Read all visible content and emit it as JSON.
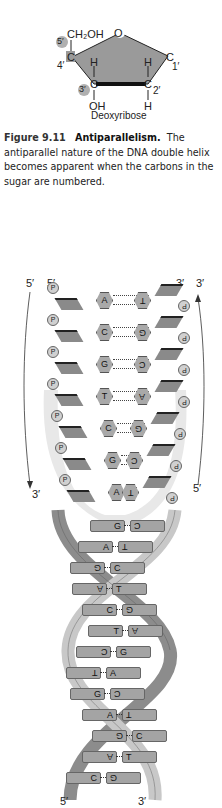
{
  "sugar": {
    "ring_oxygen": "O",
    "ch2oh": "CH₂OH",
    "c4_label": "4′",
    "c1_label": "1′",
    "c2_label": "2′",
    "c3_marker": "3′",
    "c5_marker": "5′",
    "carbon": "C",
    "h_left": "H",
    "h_right": "H",
    "oh_bottom": "OH",
    "h_bottom": "H",
    "name": "Deoxyribose",
    "colors": {
      "ring_fill": "#9a9a9a",
      "marker_fill": "#b0b0b0",
      "bond_dark": "#111111"
    }
  },
  "caption": {
    "figure_number": "Figure 9.11",
    "title": "Antiparallelism.",
    "text": "The antiparallel nature of the DNA double helix becomes apparent when the carbons in the sugar are numbered."
  },
  "ladder": {
    "left_strand": {
      "outer_top": "5′",
      "inner_top": "5′",
      "outer_bottom": "3′",
      "direction": "down"
    },
    "right_strand": {
      "outer_top": "3′",
      "inner_top": "3′",
      "outer_bottom": "5′",
      "direction": "up"
    },
    "phosphate_label": "P",
    "base_pairs": [
      {
        "left": "A",
        "right": "T"
      },
      {
        "left": "C",
        "right": "G"
      },
      {
        "left": "G",
        "right": "C"
      },
      {
        "left": "T",
        "right": "A"
      },
      {
        "left": "C",
        "right": "G"
      },
      {
        "left": "G",
        "right": "C"
      },
      {
        "left": "A",
        "right": "T"
      }
    ]
  },
  "helix": {
    "base_pairs": [
      {
        "left": "G",
        "right": "C"
      },
      {
        "left": "A",
        "right": "T"
      },
      {
        "left": "G",
        "right": "C"
      },
      {
        "left": "A",
        "right": "T"
      },
      {
        "left": "C",
        "right": "G"
      },
      {
        "left": "T",
        "right": "A"
      },
      {
        "left": "C",
        "right": "G"
      },
      {
        "left": "T",
        "right": "A"
      },
      {
        "left": "G",
        "right": "C"
      },
      {
        "left": "A",
        "right": "T"
      },
      {
        "left": "G",
        "right": "C"
      },
      {
        "left": "A",
        "right": "T"
      },
      {
        "left": "C",
        "right": "G"
      }
    ],
    "bottom_left": "5′",
    "bottom_right": "3′",
    "colors": {
      "strand_light": "#c8c8c8",
      "strand_dark": "#8c8c8c",
      "base": "#a8a8a8"
    }
  }
}
